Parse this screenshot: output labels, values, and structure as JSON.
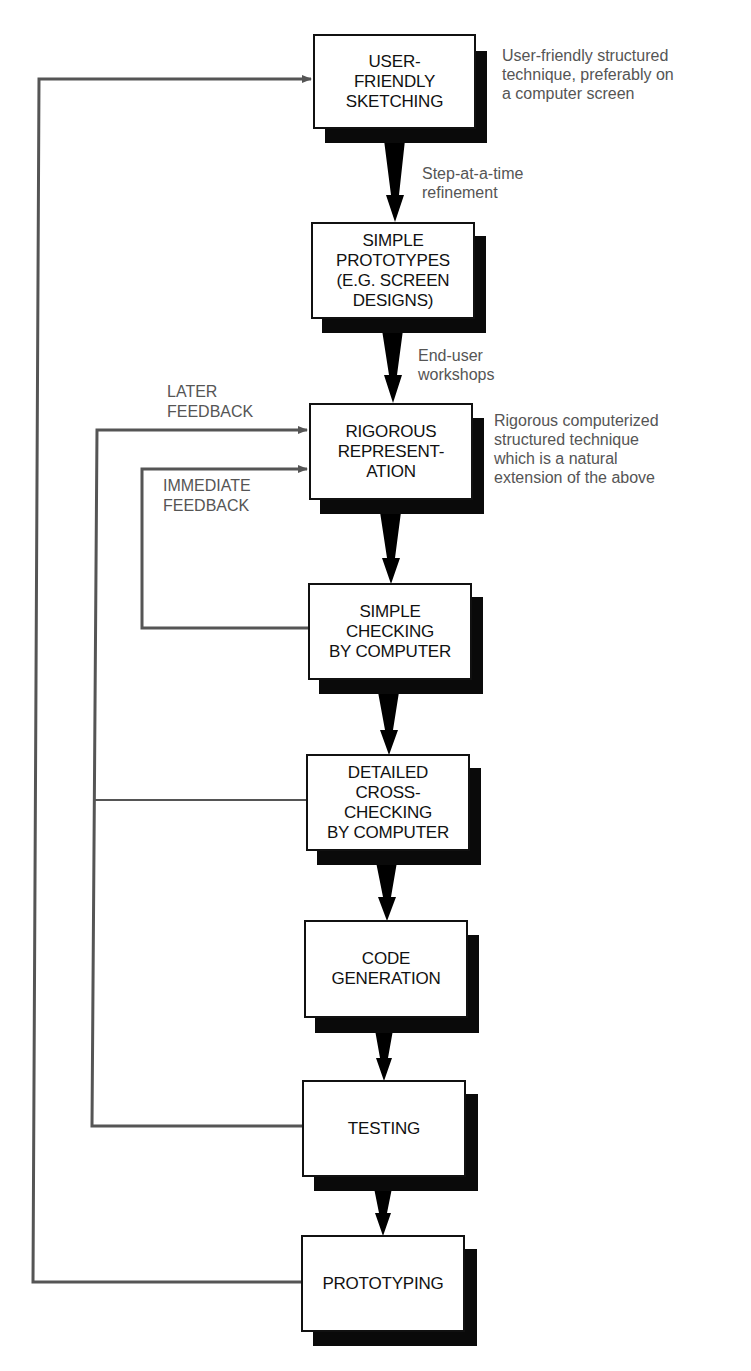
{
  "diagram": {
    "boxes": [
      {
        "id": "user-friendly-sketching",
        "label": "USER-\nFRIENDLY\nSKETCHING"
      },
      {
        "id": "simple-prototypes",
        "label": "SIMPLE\nPROTOTYPES\n(E.G. SCREEN\nDESIGNS)"
      },
      {
        "id": "rigorous-representation",
        "label": "RIGOROUS\nREPRESENT-\nATION"
      },
      {
        "id": "simple-checking",
        "label": "SIMPLE\nCHECKING\nBY COMPUTER"
      },
      {
        "id": "detailed-cross-checking",
        "label": "DETAILED\nCROSS-\nCHECKING\nBY COMPUTER"
      },
      {
        "id": "code-generation",
        "label": "CODE\nGENERATION"
      },
      {
        "id": "testing",
        "label": "TESTING"
      },
      {
        "id": "prototyping",
        "label": "PROTOTYPING"
      }
    ],
    "annotations": {
      "sketching_note": "User-friendly structured\ntechnique, preferably on\na computer screen",
      "step_refinement": "Step-at-a-time\nrefinement",
      "end_user_workshops": "End-user\nworkshops",
      "rigorous_note": "Rigorous computerized\nstructured technique\nwhich is a natural\nextension of the above"
    },
    "feedback_labels": {
      "later": "LATER\nFEEDBACK",
      "immediate": "IMMEDIATE\nFEEDBACK"
    },
    "colors": {
      "box_border": "#111111",
      "shadow": "#0a0a0a",
      "feedback_line": "#555555",
      "annotation_text": "#555555"
    }
  }
}
